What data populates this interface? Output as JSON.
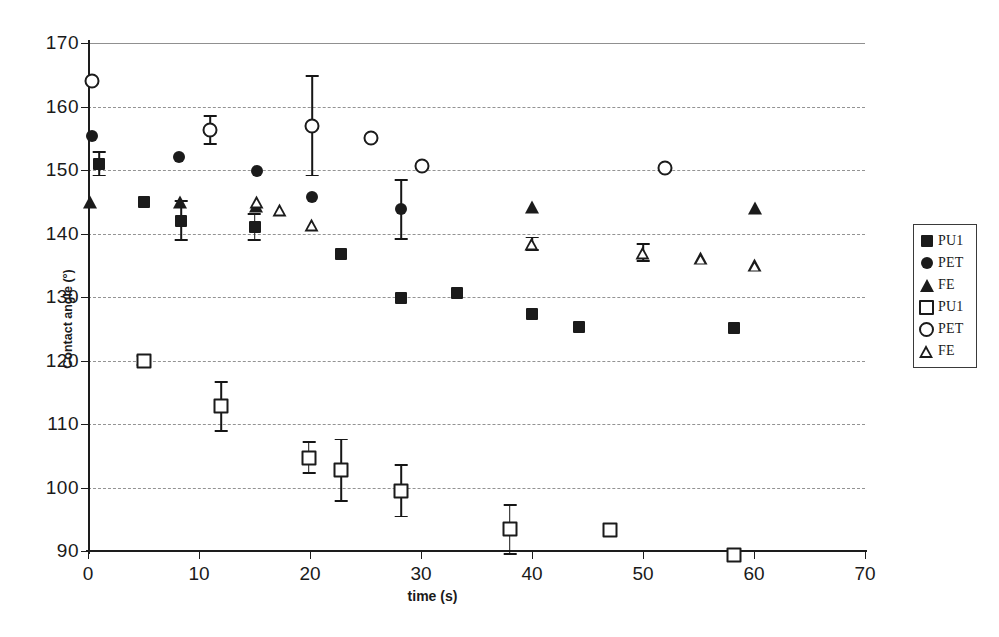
{
  "chart_data": {
    "type": "scatter",
    "title": "",
    "xlabel": "time (s)",
    "ylabel": "Contact angle (°)",
    "xlim": [
      0,
      70
    ],
    "ylim": [
      90,
      170
    ],
    "xticks": [
      0,
      10,
      20,
      30,
      40,
      50,
      60,
      70
    ],
    "yticks": [
      90,
      100,
      110,
      120,
      130,
      140,
      150,
      160,
      170
    ],
    "grid": true,
    "grid_axis": "y",
    "legend_position": "right-outside",
    "marker_color": "#1b1b1b",
    "series": [
      {
        "name": "PU1",
        "marker": "filled-square",
        "points": [
          {
            "x": 1.0,
            "y": 151.0,
            "err": 2.0
          },
          {
            "x": 5.0,
            "y": 145.0,
            "err": 0
          },
          {
            "x": 8.4,
            "y": 142.0,
            "err": 3.2
          },
          {
            "x": 15.0,
            "y": 141.0,
            "err": 2.2
          },
          {
            "x": 22.8,
            "y": 136.7,
            "err": 0
          },
          {
            "x": 28.2,
            "y": 129.8,
            "err": 0
          },
          {
            "x": 33.2,
            "y": 130.7,
            "err": 0
          },
          {
            "x": 40.0,
            "y": 127.3,
            "err": 0
          },
          {
            "x": 44.2,
            "y": 125.3,
            "err": 0
          },
          {
            "x": 58.2,
            "y": 125.1,
            "err": 0
          }
        ]
      },
      {
        "name": "PET",
        "marker": "filled-circle",
        "points": [
          {
            "x": 0.4,
            "y": 155.3,
            "err": 0
          },
          {
            "x": 8.2,
            "y": 152.0,
            "err": 0
          },
          {
            "x": 15.2,
            "y": 149.8,
            "err": 0
          },
          {
            "x": 20.2,
            "y": 145.8,
            "err": 0
          },
          {
            "x": 28.2,
            "y": 143.8,
            "err": 4.8
          }
        ]
      },
      {
        "name": "FE",
        "marker": "filled-triangle",
        "points": [
          {
            "x": 0.2,
            "y": 145.0,
            "err": 0
          },
          {
            "x": 8.3,
            "y": 145.0,
            "err": 0
          },
          {
            "x": 15.1,
            "y": 144.3,
            "err": 0
          },
          {
            "x": 40.0,
            "y": 144.2,
            "err": 0
          },
          {
            "x": 60.1,
            "y": 144.0,
            "err": 0
          }
        ]
      },
      {
        "name": "PU1",
        "marker": "open-square",
        "points": [
          {
            "x": 5.0,
            "y": 120.0,
            "err": 0.9
          },
          {
            "x": 12.0,
            "y": 112.8,
            "err": 4.0
          },
          {
            "x": 19.9,
            "y": 104.7,
            "err": 2.6
          },
          {
            "x": 22.8,
            "y": 102.7,
            "err": 5.0
          },
          {
            "x": 28.2,
            "y": 99.5,
            "err": 4.2
          },
          {
            "x": 38.0,
            "y": 93.4,
            "err": 4.0
          },
          {
            "x": 47.0,
            "y": 93.3,
            "err": 0
          },
          {
            "x": 58.2,
            "y": 89.3,
            "err": 0
          }
        ]
      },
      {
        "name": "PET",
        "marker": "open-circle",
        "points": [
          {
            "x": 0.4,
            "y": 164.0,
            "err": 0
          },
          {
            "x": 11.0,
            "y": 156.3,
            "err": 2.4
          },
          {
            "x": 20.2,
            "y": 157.0,
            "err": 8.0
          },
          {
            "x": 25.5,
            "y": 155.0,
            "err": 0
          },
          {
            "x": 30.1,
            "y": 150.7,
            "err": 0
          },
          {
            "x": 52.0,
            "y": 150.3,
            "err": 0
          }
        ]
      },
      {
        "name": "FE",
        "marker": "open-triangle",
        "points": [
          {
            "x": 15.2,
            "y": 145.0,
            "err": 0
          },
          {
            "x": 17.3,
            "y": 143.7,
            "err": 0
          },
          {
            "x": 20.2,
            "y": 141.4,
            "err": 0
          },
          {
            "x": 40.0,
            "y": 138.4,
            "err": 1.1
          },
          {
            "x": 50.0,
            "y": 137.0,
            "err": 1.5
          },
          {
            "x": 55.2,
            "y": 136.1,
            "err": 0
          },
          {
            "x": 60.1,
            "y": 135.0,
            "err": 0
          }
        ]
      }
    ]
  },
  "legend": {
    "items": [
      {
        "label": "PU1",
        "marker": "filled-square"
      },
      {
        "label": "PET",
        "marker": "filled-circle"
      },
      {
        "label": "FE",
        "marker": "filled-triangle"
      },
      {
        "label": "PU1",
        "marker": "open-square"
      },
      {
        "label": "PET",
        "marker": "open-circle"
      },
      {
        "label": "FE",
        "marker": "open-triangle"
      }
    ]
  }
}
